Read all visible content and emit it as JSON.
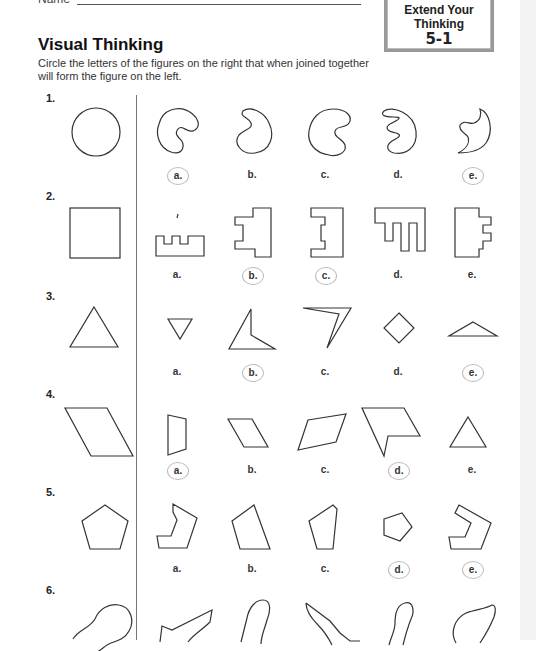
{
  "header": {
    "name_label": "Name",
    "badge": {
      "line1": "Extend Your",
      "line2": "Thinking",
      "line3": "5-1"
    }
  },
  "title": "Visual Thinking",
  "instructions": "Circle the letters of the figures on the right that when joined together will form the figure on the left.",
  "problems": [
    {
      "number": "1.",
      "target": "circle",
      "options": [
        {
          "label": "a.",
          "circled": true
        },
        {
          "label": "b.",
          "circled": false
        },
        {
          "label": "c.",
          "circled": false
        },
        {
          "label": "d.",
          "circled": false
        },
        {
          "label": "e.",
          "circled": true
        }
      ]
    },
    {
      "number": "2.",
      "target": "square",
      "options": [
        {
          "label": "a.",
          "circled": false
        },
        {
          "label": "b.",
          "circled": true
        },
        {
          "label": "c.",
          "circled": true
        },
        {
          "label": "d.",
          "circled": false
        },
        {
          "label": "e.",
          "circled": false
        }
      ]
    },
    {
      "number": "3.",
      "target": "triangle",
      "options": [
        {
          "label": "a.",
          "circled": false
        },
        {
          "label": "b.",
          "circled": true
        },
        {
          "label": "c.",
          "circled": false
        },
        {
          "label": "d.",
          "circled": false
        },
        {
          "label": "e.",
          "circled": true
        }
      ]
    },
    {
      "number": "4.",
      "target": "parallelogram",
      "options": [
        {
          "label": "a.",
          "circled": true
        },
        {
          "label": "b.",
          "circled": false
        },
        {
          "label": "c.",
          "circled": false
        },
        {
          "label": "d.",
          "circled": true
        },
        {
          "label": "e.",
          "circled": false
        }
      ]
    },
    {
      "number": "5.",
      "target": "pentagon",
      "options": [
        {
          "label": "a.",
          "circled": false
        },
        {
          "label": "b.",
          "circled": false
        },
        {
          "label": "c.",
          "circled": false
        },
        {
          "label": "d.",
          "circled": true
        },
        {
          "label": "e.",
          "circled": true
        }
      ]
    },
    {
      "number": "6.",
      "target": "blob",
      "options": []
    }
  ]
}
